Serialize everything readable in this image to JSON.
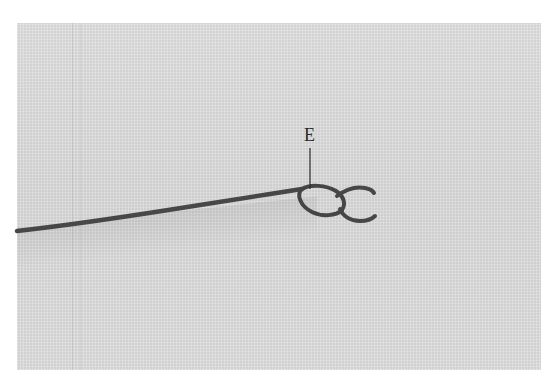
{
  "image": {
    "description": "Embroidery illustration: thread drawn across linen fabric ending in a detached chain (lazy daisy) stitch",
    "background_color": "#ffffff",
    "fabric_color": "#dedede",
    "thread_color": "#4a4a4a"
  },
  "annotation": {
    "label": "E",
    "leader_line": {
      "x": 310,
      "y1": 148,
      "y2": 188
    }
  }
}
